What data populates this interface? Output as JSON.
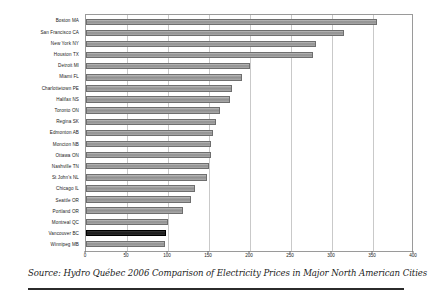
{
  "chart_data": {
    "type": "bar",
    "orientation": "horizontal",
    "title": "",
    "xlabel": "",
    "ylabel": "",
    "xlim": [
      0,
      400
    ],
    "xticks": [
      0,
      50,
      100,
      150,
      200,
      250,
      300,
      350,
      400
    ],
    "grid": true,
    "legend": false,
    "highlight_category": "Vancouver BC",
    "highlight_color": "#1a1a1a",
    "bar_color": "#9a9a9a",
    "categories": [
      "Boston MA",
      "San Francisco CA",
      "New York NY",
      "Houston TX",
      "Detroit MI",
      "Miami FL",
      "Charlottetown PE",
      "Halifax NS",
      "Toronto ON",
      "Regina SK",
      "Edmonton AB",
      "Moncton NB",
      "Ottawa ON",
      "Nashville TN",
      "St John's NL",
      "Chicago IL",
      "Seattle OR",
      "Portland OR",
      "Montreal QC",
      "Vancouver BC",
      "Winnipeg MB"
    ],
    "values": [
      355,
      315,
      281,
      277,
      200,
      190,
      178,
      175,
      163,
      158,
      155,
      153,
      152,
      150,
      148,
      133,
      128,
      118,
      100,
      98,
      96
    ]
  },
  "caption": {
    "text": "Source: Hydro Québec 2006 Comparison of Electricity Prices in Major North American Cities"
  }
}
